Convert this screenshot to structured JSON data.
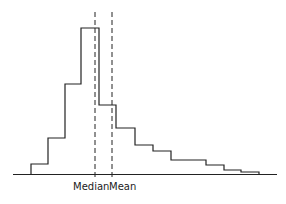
{
  "chart_data": {
    "type": "bar",
    "subtype": "histogram (step outline)",
    "title": "",
    "xlabel": "",
    "ylabel": "",
    "grid": false,
    "legend": null,
    "bin_edges_px": [
      31,
      48,
      65,
      81,
      99,
      116,
      135,
      153,
      171,
      188,
      206,
      224,
      241,
      259
    ],
    "categories": [
      "bin1",
      "bin2",
      "bin3",
      "bin4",
      "bin5",
      "bin6",
      "bin7",
      "bin8",
      "bin9",
      "bin10",
      "bin11",
      "bin12",
      "bin13"
    ],
    "values": [
      10,
      36,
      90,
      146,
      69,
      46,
      29,
      23,
      14,
      14,
      9,
      4,
      2
    ],
    "baseline_y_px": 174,
    "annotations": [
      {
        "type": "vline",
        "style": "dashed",
        "label": "Median",
        "x_px": 95
      },
      {
        "type": "vline",
        "style": "dashed",
        "label": "Mean",
        "x_px": 112
      }
    ]
  },
  "labels": {
    "median": "Median",
    "mean": "Mean"
  },
  "colors": {
    "line": "#222222",
    "background": "#ffffff"
  }
}
